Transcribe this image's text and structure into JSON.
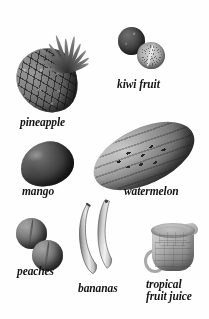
{
  "plate": {
    "title": "Fruit",
    "background_color": "#ffffff",
    "text_color": "#141414",
    "style": "grayscale photographic illustration plate"
  },
  "items": [
    {
      "id": "pineapple",
      "label": "pineapple",
      "icon": "pineapple-icon",
      "position": {
        "x": 14,
        "y": 18
      },
      "caption_position": {
        "x": 20,
        "y": 117
      }
    },
    {
      "id": "kiwi-fruit",
      "label": "kiwi fruit",
      "icon": "kiwi-fruit-icon",
      "position": {
        "x": 118,
        "y": 27
      },
      "caption_position": {
        "x": 117,
        "y": 79
      }
    },
    {
      "id": "mango",
      "label": "mango",
      "icon": "mango-icon",
      "position": {
        "x": 20,
        "y": 140
      },
      "caption_position": {
        "x": 22,
        "y": 186
      }
    },
    {
      "id": "watermelon",
      "label": "watermelon",
      "icon": "watermelon-icon",
      "position": {
        "x": 88,
        "y": 126
      },
      "caption_position": {
        "x": 124,
        "y": 186
      }
    },
    {
      "id": "peaches",
      "label": "peaches",
      "icon": "peaches-icon",
      "position": {
        "x": 14,
        "y": 218
      },
      "caption_position": {
        "x": 17,
        "y": 266
      }
    },
    {
      "id": "bananas",
      "label": "bananas",
      "icon": "bananas-icon",
      "position": {
        "x": 76,
        "y": 198
      },
      "caption_position": {
        "x": 78,
        "y": 283
      }
    },
    {
      "id": "tropical-fruit-juice",
      "label": "tropical\nfruit juice",
      "icon": "measuring-cup-icon",
      "position": {
        "x": 145,
        "y": 219
      },
      "caption_position": {
        "x": 146,
        "y": 279
      }
    }
  ]
}
